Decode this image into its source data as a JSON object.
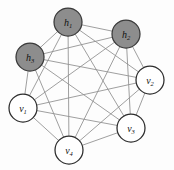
{
  "figure": {
    "background_color": "#fdfdfd",
    "width": 174,
    "height": 170,
    "graph_type": "complete-graph"
  },
  "style": {
    "hidden_fill": "#8d8d8d",
    "visible_fill": "#ffffff",
    "node_stroke": "#2c2c2c",
    "hidden_node_stroke": "#3a3a3a",
    "edge_color": "#8e8e8e",
    "edge_width": 0.85,
    "node_radius": 14
  },
  "chart_data": {
    "type": "graph",
    "title": "",
    "layout": "circular",
    "node_count": 7,
    "edge_count": 21,
    "complete": true,
    "nodes": [
      {
        "id": "h1",
        "base": "h",
        "sub": "1",
        "kind": "hidden",
        "shaded": true,
        "cx": 68,
        "cy": 22,
        "r": 14
      },
      {
        "id": "h2",
        "base": "h",
        "sub": "2",
        "kind": "hidden",
        "shaded": true,
        "cx": 126,
        "cy": 34,
        "r": 14
      },
      {
        "id": "h3",
        "base": "h",
        "sub": "3",
        "kind": "hidden",
        "shaded": true,
        "cx": 30,
        "cy": 57,
        "r": 14
      },
      {
        "id": "v1",
        "base": "v",
        "sub": "1",
        "kind": "visible",
        "shaded": false,
        "cx": 23,
        "cy": 108,
        "r": 14
      },
      {
        "id": "v2",
        "base": "v",
        "sub": "2",
        "kind": "visible",
        "shaded": false,
        "cx": 150,
        "cy": 80,
        "r": 14
      },
      {
        "id": "v3",
        "base": "v",
        "sub": "3",
        "kind": "visible",
        "shaded": false,
        "cx": 131,
        "cy": 128,
        "r": 14
      },
      {
        "id": "v4",
        "base": "v",
        "sub": "4",
        "kind": "visible",
        "shaded": false,
        "cx": 69,
        "cy": 150,
        "r": 14
      }
    ],
    "edges": [
      [
        "h1",
        "h2"
      ],
      [
        "h1",
        "h3"
      ],
      [
        "h1",
        "v1"
      ],
      [
        "h1",
        "v2"
      ],
      [
        "h1",
        "v3"
      ],
      [
        "h1",
        "v4"
      ],
      [
        "h2",
        "h3"
      ],
      [
        "h2",
        "v1"
      ],
      [
        "h2",
        "v2"
      ],
      [
        "h2",
        "v3"
      ],
      [
        "h2",
        "v4"
      ],
      [
        "h3",
        "v1"
      ],
      [
        "h3",
        "v2"
      ],
      [
        "h3",
        "v3"
      ],
      [
        "h3",
        "v4"
      ],
      [
        "v1",
        "v2"
      ],
      [
        "v1",
        "v3"
      ],
      [
        "v1",
        "v4"
      ],
      [
        "v2",
        "v3"
      ],
      [
        "v2",
        "v4"
      ],
      [
        "v3",
        "v4"
      ]
    ]
  }
}
